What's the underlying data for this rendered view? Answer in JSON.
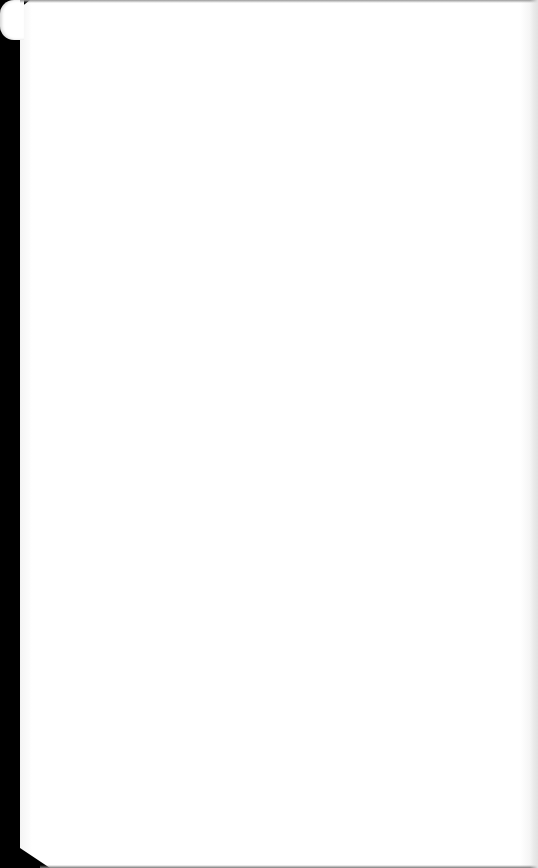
{
  "document": {
    "type": "scanned-page",
    "content": "",
    "colors": {
      "paper": "#ffffff",
      "background": "#000000",
      "edge_shade": "#e2e2e2"
    }
  }
}
